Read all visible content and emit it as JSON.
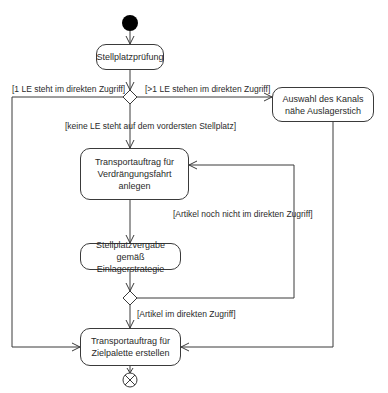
{
  "diagram": {
    "type": "UML activity diagram",
    "nodes": {
      "start": {
        "kind": "initial"
      },
      "stellplatzpruefung": {
        "label": "Stellplatzprüfung"
      },
      "auswahl_kanal": {
        "label": "Auswahl des Kanals\nnähe Auslagerstich"
      },
      "verdraengungsfahrt": {
        "label": "Transportauftrag für\nVerdrängungsfahrt\nanlegen"
      },
      "stellplatzvergabe": {
        "label": "Stellplatzvergabe gemäß\nEinlagerstrategie"
      },
      "zielpalette": {
        "label": "Transportauftrag für\nZielpalette erstellen"
      },
      "decision1": {
        "kind": "decision"
      },
      "decision2": {
        "kind": "decision"
      },
      "end": {
        "kind": "final"
      }
    },
    "guards": {
      "one_le": "[1 LE steht im direkten Zugriff]",
      "more_le": "[>1 LE stehen im direkten Zugriff]",
      "no_le": "[keine LE  steht auf dem vordersten Stellplatz]",
      "not_yet": "[Artikel  noch nicht im direkten Zugriff]",
      "in_access": "[Artikel im direkten Zugriff]"
    },
    "edges": [
      {
        "from": "start",
        "to": "stellplatzpruefung"
      },
      {
        "from": "stellplatzpruefung",
        "to": "decision1"
      },
      {
        "from": "decision1",
        "to": "zielpalette",
        "guard": "one_le"
      },
      {
        "from": "decision1",
        "to": "auswahl_kanal",
        "guard": "more_le"
      },
      {
        "from": "decision1",
        "to": "verdraengungsfahrt",
        "guard": "no_le"
      },
      {
        "from": "verdraengungsfahrt",
        "to": "stellplatzvergabe"
      },
      {
        "from": "stellplatzvergabe",
        "to": "decision2"
      },
      {
        "from": "decision2",
        "to": "verdraengungsfahrt",
        "guard": "not_yet"
      },
      {
        "from": "decision2",
        "to": "zielpalette",
        "guard": "in_access"
      },
      {
        "from": "auswahl_kanal",
        "to": "zielpalette"
      },
      {
        "from": "zielpalette",
        "to": "end"
      }
    ],
    "colors": {
      "line": "#3a3a3a",
      "text": "#2a2a2a",
      "background": "#ffffff"
    }
  }
}
